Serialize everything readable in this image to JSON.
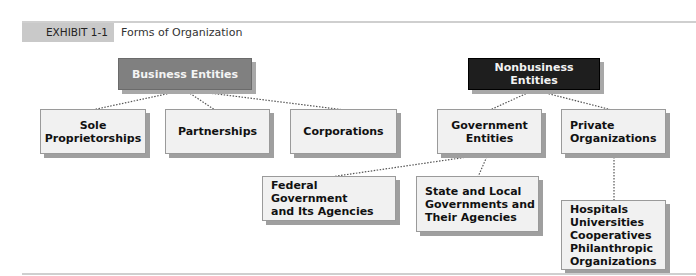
{
  "exhibit": {
    "label": "EXHIBIT 1-1",
    "title": "Forms of Organization"
  },
  "nodes": {
    "business": "Business Entities",
    "nonbusiness": "Nonbusiness Entities",
    "sole": "Sole\nProprietorships",
    "partnerships": "Partnerships",
    "corporations": "Corporations",
    "government": "Government\nEntities",
    "private": "Private\nOrganizations",
    "federal": "Federal Government\nand Its Agencies",
    "state": "State and Local\nGovernments and\nTheir Agencies",
    "private_list": "Hospitals\nUniversities\nCooperatives\nPhilanthropic\n  Organizations"
  },
  "colors": {
    "business_head": "#808080",
    "nonbusiness_head": "#1e1e1e",
    "box_fill": "#f1f1f1",
    "shadow": "#9f9f9f"
  }
}
